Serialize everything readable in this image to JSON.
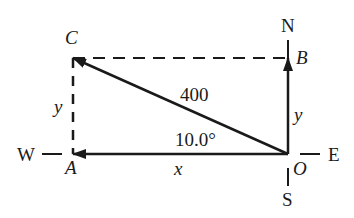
{
  "diagram": {
    "type": "vector-components",
    "compass": {
      "north": "N",
      "south": "S",
      "east": "E",
      "west": "W"
    },
    "points": {
      "origin": "O",
      "a": "A",
      "b": "B",
      "c": "C"
    },
    "labels": {
      "magnitude": "400",
      "angle": "10.0°",
      "x_component": "x",
      "y_component_left": "y",
      "y_component_right": "y"
    },
    "colors": {
      "line": "#1a1a1a",
      "background": "#ffffff"
    }
  }
}
